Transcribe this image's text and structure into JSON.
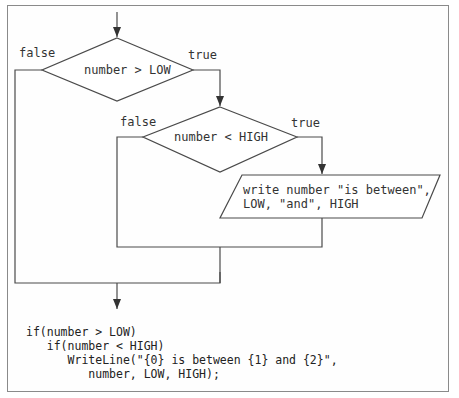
{
  "diagram": {
    "type": "flowchart",
    "decisions": [
      {
        "id": "d1",
        "text": "number > LOW",
        "true_label": "true",
        "false_label": "false"
      },
      {
        "id": "d2",
        "text": "number < HIGH",
        "true_label": "true",
        "false_label": "false"
      }
    ],
    "io": {
      "line1": "write number \"is between\",",
      "line2": "LOW, \"and\", HIGH"
    }
  },
  "code": {
    "lines": [
      "if(number > LOW)",
      "   if(number < HIGH)",
      "      WriteLine(\"{0} is between {1} and {2}\",",
      "         number, LOW, HIGH);"
    ]
  },
  "colors": {
    "line": "#4a4a4a",
    "frame": "#8a8a8a",
    "text": "#333333"
  }
}
